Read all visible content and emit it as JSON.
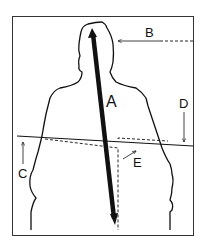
{
  "diagram": {
    "labels": {
      "A": "A",
      "B": "B",
      "C": "C",
      "D": "D",
      "E": "E"
    },
    "colors": {
      "stroke": "#111111",
      "background": "#ffffff"
    }
  }
}
